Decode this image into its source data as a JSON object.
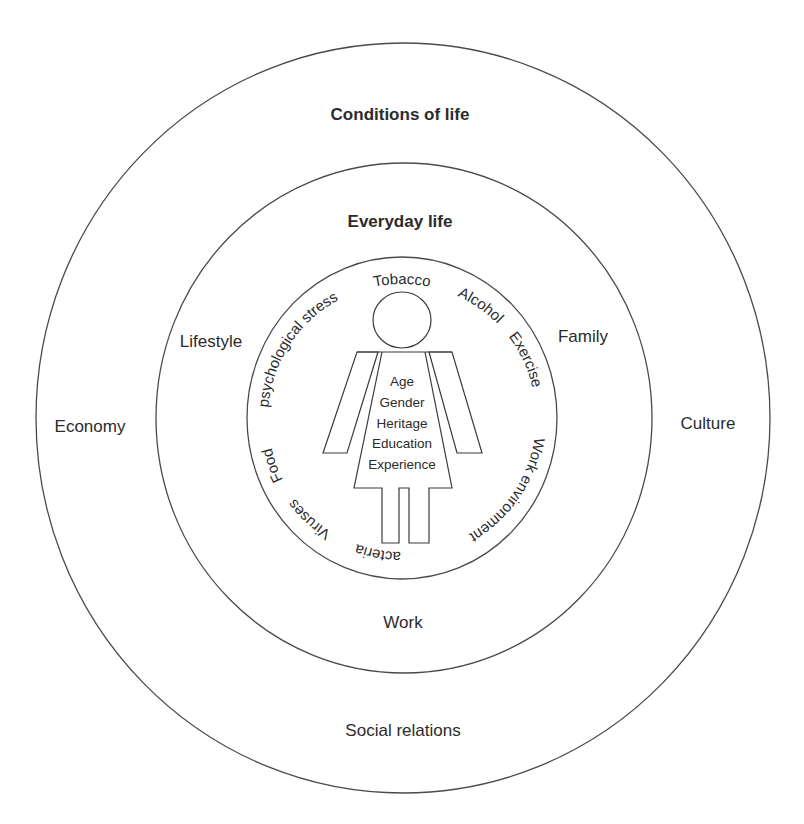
{
  "diagram": {
    "outer_ring": {
      "title": "Conditions of life",
      "labels": {
        "left": "Economy",
        "right": "Culture",
        "bottom": "Social relations"
      }
    },
    "middle_ring": {
      "title": "Everyday life",
      "labels": {
        "left": "Lifestyle",
        "right": "Family",
        "bottom": "Work"
      }
    },
    "inner_ring": {
      "curved_labels": [
        {
          "text": "Tobacco",
          "offset": "50%"
        },
        {
          "text": "Alcohol",
          "offset": "59.7%"
        },
        {
          "text": "Exercise",
          "offset": "68%"
        },
        {
          "text": "Work environment",
          "offset": "84.5%"
        },
        {
          "text": "Bacteria",
          "offset": "2.2%"
        },
        {
          "text": "Viruses",
          "offset": "11.8%"
        },
        {
          "text": "Food",
          "offset": "19.4%"
        },
        {
          "text": "psychological stress",
          "offset": "34.2%"
        }
      ]
    },
    "person": {
      "attributes": [
        "Age",
        "Gender",
        "Heritage",
        "Education",
        "Experience"
      ]
    },
    "colors": {
      "stroke": "#4a4a4a",
      "text": "#2b2b2b",
      "background": "#ffffff"
    }
  }
}
